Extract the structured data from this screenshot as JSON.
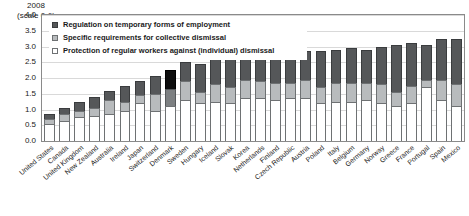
{
  "chart_data": {
    "type": "bar",
    "subtype": "stacked-bar",
    "title": "2008",
    "subtitle": "(scale 0-6)",
    "xlabel": "",
    "ylabel": "",
    "ylim": [
      0.0,
      4.0
    ],
    "ytick_labels": [
      "0.0",
      "0.5",
      "1.0",
      "1.5",
      "2.0",
      "2.5",
      "3.0",
      "3.5",
      "4.0"
    ],
    "ytick_values": [
      0.0,
      0.5,
      1.0,
      1.5,
      2.0,
      2.5,
      3.0,
      3.5,
      4.0
    ],
    "grid": true,
    "legend_position": "top-left",
    "highlight_category": "Denmark",
    "highlight_color": "#0d0d0d",
    "colors": {
      "temporary": "#555759",
      "collective": "#b8bbbd",
      "regular": "#ffffff",
      "gridline": "#d9d9d9",
      "frame": "#8a8a8a"
    },
    "categories": [
      "United States",
      "Canada",
      "United Kingdom",
      "New Zealand",
      "Australia",
      "Ireland",
      "Japan",
      "Switzerland",
      "Denmark",
      "Sweden",
      "Hungary",
      "Iceland",
      "Slovak",
      "Korea",
      "Netherlands",
      "Finland",
      "Czech Republic",
      "Austria",
      "Poland",
      "Italy",
      "Belgium",
      "Germany",
      "Norway",
      "Greece",
      "France",
      "Portugal",
      "Spain",
      "Mexico"
    ],
    "series": [
      {
        "name": "Protection of regular workers against (individual) dismissal",
        "key": "regular",
        "values": [
          0.55,
          0.65,
          0.75,
          0.8,
          0.85,
          0.95,
          1.2,
          0.95,
          1.1,
          1.3,
          1.2,
          1.25,
          1.2,
          1.35,
          1.35,
          1.3,
          1.35,
          1.35,
          1.2,
          1.25,
          1.25,
          1.3,
          1.2,
          1.1,
          1.2,
          1.7,
          1.3,
          1.1
        ]
      },
      {
        "name": "Specific requirements for collective dismissal",
        "key": "collective",
        "values": [
          0.15,
          0.2,
          0.2,
          0.25,
          0.45,
          0.3,
          0.25,
          0.55,
          0.55,
          0.6,
          0.35,
          0.55,
          0.5,
          0.6,
          0.55,
          0.55,
          0.5,
          0.6,
          0.5,
          0.6,
          0.6,
          0.55,
          0.6,
          0.45,
          0.55,
          0.25,
          0.65,
          0.7
        ]
      },
      {
        "name": "Regulation on temporary forms of employment",
        "key": "temporary",
        "values": [
          0.15,
          0.2,
          0.3,
          0.35,
          0.3,
          0.5,
          0.45,
          0.55,
          0.6,
          0.6,
          0.9,
          0.8,
          0.9,
          0.8,
          0.85,
          0.95,
          0.95,
          0.9,
          1.15,
          1.05,
          1.1,
          1.05,
          1.2,
          1.5,
          1.35,
          1.1,
          1.3,
          1.45
        ]
      }
    ]
  }
}
